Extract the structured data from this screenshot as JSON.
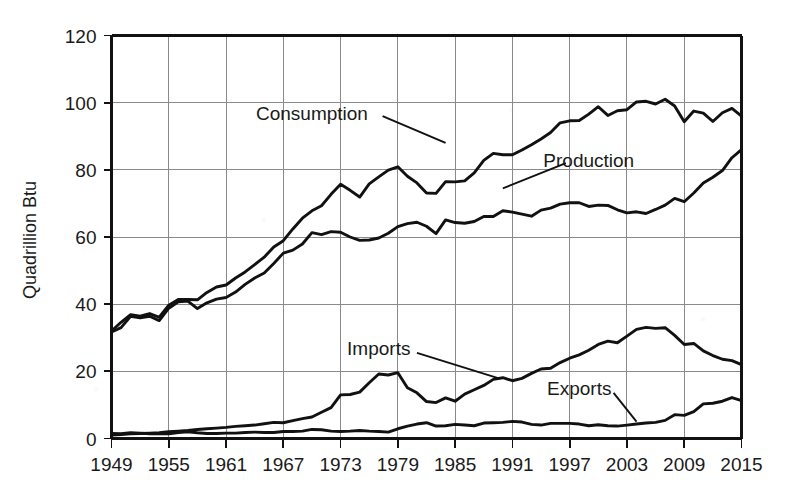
{
  "chart_data": {
    "type": "line",
    "title": "",
    "xlabel": "",
    "ylabel": "Quadrillion Btu",
    "xlim": [
      1949,
      2015
    ],
    "ylim": [
      0,
      120
    ],
    "yticks": [
      0,
      20,
      40,
      60,
      80,
      100,
      120
    ],
    "xticks": [
      1949,
      1955,
      1961,
      1967,
      1973,
      1979,
      1985,
      1991,
      1997,
      2003,
      2009,
      2015
    ],
    "grid": true,
    "legend_position": "inline-annotations",
    "annotations": [
      {
        "text": "Consumption",
        "x": 1970,
        "y": 97
      },
      {
        "text": "Production",
        "x": 1999,
        "y": 83
      },
      {
        "text": "Imports",
        "x": 1977,
        "y": 27
      },
      {
        "text": "Exports",
        "x": 1998,
        "y": 15
      }
    ],
    "x": [
      1949,
      1950,
      1951,
      1952,
      1953,
      1954,
      1955,
      1956,
      1957,
      1958,
      1959,
      1960,
      1961,
      1962,
      1963,
      1964,
      1965,
      1966,
      1967,
      1968,
      1969,
      1970,
      1971,
      1972,
      1973,
      1974,
      1975,
      1976,
      1977,
      1978,
      1979,
      1980,
      1981,
      1982,
      1983,
      1984,
      1985,
      1986,
      1987,
      1988,
      1989,
      1990,
      1991,
      1992,
      1993,
      1994,
      1995,
      1996,
      1997,
      1998,
      1999,
      2000,
      2001,
      2002,
      2003,
      2004,
      2005,
      2006,
      2007,
      2008,
      2009,
      2010,
      2011,
      2012,
      2013,
      2014,
      2015
    ],
    "series": [
      {
        "name": "Consumption",
        "values": [
          32.0,
          34.6,
          36.9,
          36.4,
          37.2,
          36.1,
          39.7,
          41.4,
          41.4,
          41.3,
          43.5,
          45.1,
          45.7,
          47.8,
          49.6,
          51.8,
          54.0,
          57.0,
          58.9,
          62.4,
          65.6,
          67.8,
          69.3,
          72.7,
          75.7,
          73.9,
          71.9,
          75.8,
          77.9,
          79.9,
          80.9,
          78.1,
          76.1,
          73.1,
          73.0,
          76.5,
          76.4,
          76.7,
          79.1,
          82.8,
          84.9,
          84.5,
          84.5,
          85.9,
          87.5,
          89.2,
          91.1,
          94.0,
          94.6,
          94.7,
          96.6,
          98.8,
          96.2,
          97.6,
          97.9,
          100.2,
          100.4,
          99.6,
          101.0,
          99.0,
          94.3,
          97.5,
          96.9,
          94.4,
          97.0,
          98.3,
          96.0
        ]
      },
      {
        "name": "Production",
        "values": [
          31.7,
          33.0,
          36.4,
          35.9,
          36.4,
          35.1,
          38.8,
          40.7,
          40.9,
          38.7,
          40.4,
          41.5,
          42.0,
          43.6,
          45.9,
          47.8,
          49.3,
          52.1,
          55.2,
          56.1,
          57.9,
          61.3,
          60.7,
          61.6,
          61.4,
          60.0,
          59.0,
          59.1,
          59.7,
          61.1,
          63.1,
          64.0,
          64.4,
          63.2,
          61.0,
          65.1,
          64.3,
          64.1,
          64.6,
          66.1,
          66.1,
          67.8,
          67.4,
          66.8,
          66.2,
          68.0,
          68.6,
          69.8,
          70.2,
          70.2,
          69.1,
          69.5,
          69.4,
          68.1,
          67.2,
          67.5,
          67.0,
          68.2,
          69.5,
          71.5,
          70.5,
          73.1,
          76.1,
          77.8,
          79.8,
          83.6,
          86.0
        ]
      },
      {
        "name": "Imports",
        "values": [
          1.0,
          1.2,
          1.4,
          1.5,
          1.6,
          1.7,
          2.0,
          2.2,
          2.4,
          2.7,
          2.9,
          3.1,
          3.3,
          3.6,
          3.8,
          4.0,
          4.4,
          4.8,
          4.7,
          5.3,
          5.9,
          6.4,
          7.8,
          9.2,
          13.0,
          13.1,
          13.8,
          16.6,
          19.2,
          18.9,
          19.6,
          15.1,
          13.6,
          11.0,
          10.7,
          12.1,
          11.1,
          13.2,
          14.5,
          15.8,
          17.6,
          18.1,
          17.2,
          17.9,
          19.4,
          20.7,
          20.9,
          22.6,
          23.9,
          24.9,
          26.3,
          28.0,
          29.0,
          28.5,
          30.5,
          32.5,
          33.1,
          32.8,
          33.0,
          30.7,
          28.0,
          28.3,
          26.1,
          24.7,
          23.6,
          23.2,
          22.0
        ]
      },
      {
        "name": "Exports",
        "values": [
          1.5,
          1.4,
          1.7,
          1.6,
          1.4,
          1.4,
          1.4,
          1.8,
          2.0,
          1.7,
          1.5,
          1.5,
          1.6,
          1.6,
          1.8,
          1.9,
          1.8,
          1.8,
          2.1,
          2.1,
          2.2,
          2.7,
          2.6,
          2.2,
          2.1,
          2.2,
          2.4,
          2.2,
          2.1,
          1.9,
          2.9,
          3.7,
          4.3,
          4.7,
          3.7,
          3.8,
          4.2,
          4.0,
          3.8,
          4.6,
          4.7,
          4.8,
          5.1,
          4.9,
          4.2,
          4.0,
          4.5,
          4.5,
          4.5,
          4.3,
          3.8,
          4.1,
          3.8,
          3.7,
          4.0,
          4.3,
          4.6,
          4.8,
          5.4,
          7.1,
          6.9,
          8.0,
          10.3,
          10.5,
          11.1,
          12.2,
          11.3
        ]
      }
    ]
  }
}
